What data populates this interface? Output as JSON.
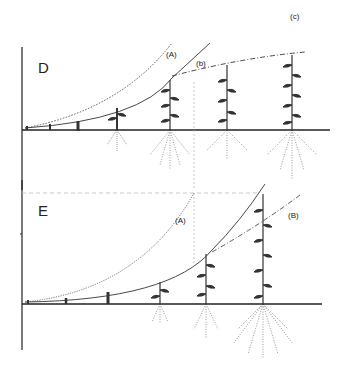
{
  "figure": {
    "label": "(c)",
    "panels": [
      {
        "id": "D",
        "letter": "D",
        "curves": [
          {
            "name": "(A)",
            "style": "dotted"
          },
          {
            "name": "(b)",
            "style": "solid-then-dashdot"
          }
        ],
        "plant_count": 7
      },
      {
        "id": "E",
        "letter": "E",
        "curves": [
          {
            "name": "(A)",
            "style": "dotted"
          },
          {
            "name": "(B)",
            "style": "solid-dashed"
          }
        ],
        "plant_count": 6
      }
    ]
  },
  "colors": {
    "ink": "#1e1e1e",
    "background": "#ffffff"
  }
}
